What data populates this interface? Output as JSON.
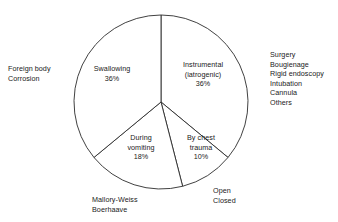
{
  "figure": {
    "background_color": "#ffffff",
    "stroke_color": "#2b2b2b",
    "text_color": "#1a1a1a"
  },
  "chart_data": {
    "type": "pie",
    "title": "",
    "subtitle": "",
    "xlabel": "",
    "ylabel": "",
    "legend_position": "none",
    "grid": false,
    "start_angle_deg": 0,
    "direction": "clockwise",
    "center_px": [
      161,
      102
    ],
    "radius_px": 87,
    "categories": [
      "Instrumental (iatrogenic)",
      "By chest trauma",
      "During vomiting",
      "Swallowing"
    ],
    "values": [
      36,
      10,
      18,
      36
    ],
    "value_unit": "%",
    "slices": [
      {
        "label_line1": "Instrumental",
        "label_line2": "(iatrogenic)",
        "value_label": "36%",
        "value": 36,
        "start_deg": 0,
        "end_deg": 129.6,
        "annotation_side": "right"
      },
      {
        "label_line1": "By chest",
        "label_line2": "trauma",
        "value_label": "10%",
        "value": 10,
        "start_deg": 129.6,
        "end_deg": 165.6,
        "annotation_side": "bottom-right"
      },
      {
        "label_line1": "During",
        "label_line2": "vomiting",
        "value_label": "18%",
        "value": 18,
        "start_deg": 165.6,
        "end_deg": 230.4,
        "annotation_side": "bottom-left"
      },
      {
        "label_line1": "Swallowing",
        "label_line2": "",
        "value_label": "36%",
        "value": 36,
        "start_deg": 230.4,
        "end_deg": 360,
        "annotation_side": "left"
      }
    ],
    "annotations": {
      "left": [
        "Foreign body",
        "Corrosion"
      ],
      "right": [
        "Surgery",
        "Bougienage",
        "Rigid endoscopy",
        "Intubation",
        "Cannula",
        "Others"
      ],
      "bottom_left": [
        "Mallory-Weiss",
        "Boerhaave"
      ],
      "bottom_right": [
        "Open",
        "Closed"
      ]
    }
  }
}
